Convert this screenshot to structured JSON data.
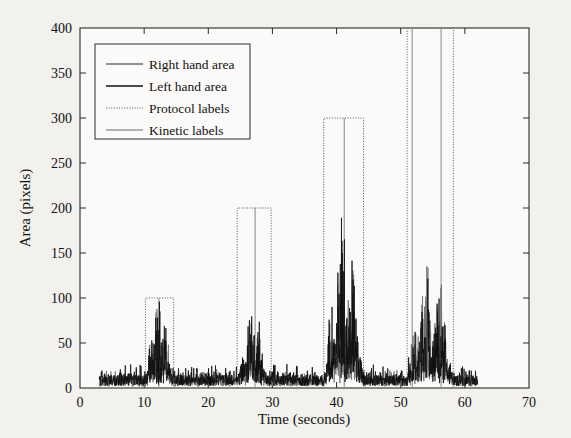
{
  "chart_data": {
    "type": "line",
    "title": "",
    "xlabel": "Time (seconds)",
    "ylabel": "Area (pixels)",
    "xlim": [
      0,
      70
    ],
    "ylim": [
      0,
      400
    ],
    "xticks": [
      0,
      10,
      20,
      30,
      40,
      50,
      60,
      70
    ],
    "yticks": [
      0,
      50,
      100,
      150,
      200,
      250,
      300,
      350,
      400
    ],
    "grid": false,
    "legend_position": "upper-left",
    "series": [
      {
        "name": "Right hand area",
        "style": "solid",
        "color": "#6f6f6f",
        "comment": "gray hand-area signal, noisy, bursts during protocol windows",
        "x_range": [
          3.0,
          62.0
        ],
        "baseline": 7,
        "bursts": [
          {
            "t_start": 10.2,
            "t_end": 14.6,
            "peak": 78
          },
          {
            "t_start": 24.6,
            "t_end": 29.2,
            "peak": 62
          },
          {
            "t_start": 38.2,
            "t_end": 44.2,
            "peak": 150
          },
          {
            "t_start": 51.0,
            "t_end": 58.2,
            "peak": 128
          }
        ]
      },
      {
        "name": "Left hand area",
        "style": "solid",
        "color": "#101010",
        "comment": "black hand-area signal, noisy, bursts during protocol windows",
        "x_range": [
          3.0,
          62.0
        ],
        "baseline": 9,
        "bursts": [
          {
            "t_start": 10.2,
            "t_end": 14.6,
            "peak": 86
          },
          {
            "t_start": 24.6,
            "t_end": 29.2,
            "peak": 70
          },
          {
            "t_start": 38.2,
            "t_end": 44.2,
            "peak": 170
          },
          {
            "t_start": 51.0,
            "t_end": 58.2,
            "peak": 118
          }
        ]
      },
      {
        "name": "Protocol labels",
        "style": "dotted",
        "color": "#555555",
        "comment": "rectangular pulse boxes marking protocol intervals",
        "boxes": [
          {
            "t_start": 10.2,
            "t_end": 14.6,
            "level": 100
          },
          {
            "t_start": 24.5,
            "t_end": 29.8,
            "level": 200
          },
          {
            "t_start": 38.0,
            "t_end": 44.2,
            "level": 300
          },
          {
            "t_start": 51.0,
            "t_end": 58.2,
            "level": 400
          }
        ]
      },
      {
        "name": "Kinetic labels",
        "style": "solid",
        "color": "#999999",
        "comment": "light gray vertical event markers inside protocol windows",
        "marks": [
          {
            "t": 12.3,
            "level": 100
          },
          {
            "t": 27.3,
            "level": 200
          },
          {
            "t": 41.2,
            "level": 300
          },
          {
            "t": 51.8,
            "level": 400
          },
          {
            "t": 56.3,
            "level": 400
          }
        ]
      }
    ]
  },
  "axes": {
    "xlabel": "Time (seconds)",
    "ylabel": "Area (pixels)",
    "xticks": [
      "0",
      "10",
      "20",
      "30",
      "40",
      "50",
      "60",
      "70"
    ],
    "yticks": [
      "0",
      "50",
      "100",
      "150",
      "200",
      "250",
      "300",
      "350",
      "400"
    ]
  },
  "legend": {
    "items": [
      {
        "label": "Right hand area",
        "style": "solid",
        "color": "#6f6f6f"
      },
      {
        "label": "Left hand area",
        "style": "solid",
        "color": "#101010"
      },
      {
        "label": "Protocol labels",
        "style": "dotted",
        "color": "#555555"
      },
      {
        "label": "Kinetic labels",
        "style": "solid",
        "color": "#9a9a9a"
      }
    ]
  }
}
